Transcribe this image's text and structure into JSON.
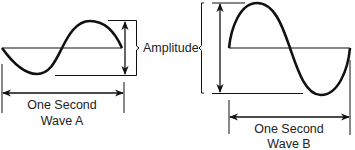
{
  "diagram": {
    "amplitude_label": "Amplitude",
    "wave_a": {
      "period_label": "One Second",
      "name": "Wave A"
    },
    "wave_b": {
      "period_label": "One Second",
      "name": "Wave B"
    },
    "colors": {
      "stroke": "#111111",
      "text": "#222222",
      "background": "#ffffff"
    }
  }
}
